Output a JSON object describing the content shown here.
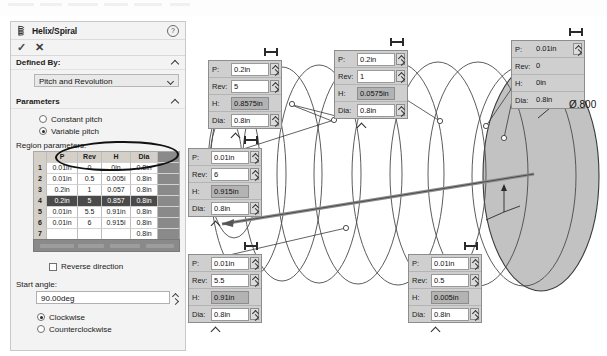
{
  "panel": {
    "title": "Helix/Spiral",
    "icon": "helix-icon",
    "help_icon": "help-icon",
    "accept_icon": "checkmark-icon",
    "cancel_icon": "close-icon",
    "sections": {
      "defined_by": {
        "label": "Defined By:",
        "value": "Pitch and Revolution"
      },
      "parameters": {
        "label": "Parameters",
        "constant_pitch": "Constant pitch",
        "variable_pitch": "Variable pitch",
        "selected": "Variable pitch"
      },
      "region_parameters": {
        "label": "Region parameters:",
        "columns": [
          "",
          "P",
          "Rev",
          "H",
          "Dia"
        ],
        "rows": [
          {
            "idx": "1",
            "p": "0.01in",
            "rev": "0",
            "h": "0in",
            "dia": "0.8in",
            "selected": false
          },
          {
            "idx": "2",
            "p": "0.01in",
            "rev": "0.5",
            "h": "0.005i",
            "dia": "0.8in",
            "selected": false
          },
          {
            "idx": "3",
            "p": "0.2in",
            "rev": "1",
            "h": "0.057",
            "dia": "0.8in",
            "selected": false
          },
          {
            "idx": "4",
            "p": "0.2in",
            "rev": "5",
            "h": "0.857",
            "dia": "0.8in",
            "selected": true
          },
          {
            "idx": "5",
            "p": "0.01in",
            "rev": "5.5",
            "h": "0.91in",
            "dia": "0.8in",
            "selected": false
          },
          {
            "idx": "6",
            "p": "0.01in",
            "rev": "6",
            "h": "0.915i",
            "dia": "0.8in",
            "selected": false
          },
          {
            "idx": "7",
            "p": "",
            "rev": "",
            "h": "",
            "dia": "0.8in",
            "selected": false
          }
        ]
      },
      "reverse_direction": {
        "label": "Reverse direction",
        "checked": false
      },
      "start_angle": {
        "label": "Start angle:",
        "value": "90.00deg"
      },
      "direction": {
        "clockwise": "Clockwise",
        "counterclockwise": "Counterclockwise",
        "selected": "Clockwise"
      }
    }
  },
  "graphics": {
    "dimension_label": "Ø.800",
    "callouts": [
      {
        "id": "callout-rev5",
        "rows": [
          {
            "key": "P:",
            "value": "0.2in",
            "spinner": true,
            "highlight": false
          },
          {
            "key": "Rev:",
            "value": "5",
            "spinner": true,
            "highlight": false
          },
          {
            "key": "H:",
            "value": "0.8575in",
            "spinner": false,
            "highlight": true
          },
          {
            "key": "Dia:",
            "value": "0.8in",
            "spinner": true,
            "highlight": false
          }
        ]
      },
      {
        "id": "callout-rev1",
        "rows": [
          {
            "key": "P:",
            "value": "0.2in",
            "spinner": true,
            "highlight": false
          },
          {
            "key": "Rev:",
            "value": "1",
            "spinner": true,
            "highlight": false
          },
          {
            "key": "H:",
            "value": "0.0575in",
            "spinner": false,
            "highlight": true
          },
          {
            "key": "Dia:",
            "value": "0.8in",
            "spinner": true,
            "highlight": false
          }
        ]
      },
      {
        "id": "callout-rev0",
        "rows": [
          {
            "key": "P:",
            "value": "0.01in",
            "spinner": true,
            "highlight": false
          },
          {
            "key": "Rev:",
            "value": "0",
            "spinner": false,
            "highlight": false
          },
          {
            "key": "H:",
            "value": "0in",
            "spinner": false,
            "highlight": false
          },
          {
            "key": "Dia:",
            "value": "0.8in",
            "spinner": false,
            "highlight": false
          }
        ]
      },
      {
        "id": "callout-rev6",
        "rows": [
          {
            "key": "P:",
            "value": "0.01in",
            "spinner": true,
            "highlight": false
          },
          {
            "key": "Rev:",
            "value": "6",
            "spinner": true,
            "highlight": false
          },
          {
            "key": "H:",
            "value": "0.915in",
            "spinner": false,
            "highlight": true
          },
          {
            "key": "Dia:",
            "value": "0.8in",
            "spinner": true,
            "highlight": false
          }
        ]
      },
      {
        "id": "callout-rev55",
        "rows": [
          {
            "key": "P:",
            "value": "0.01in",
            "spinner": true,
            "highlight": false
          },
          {
            "key": "Rev:",
            "value": "5.5",
            "spinner": true,
            "highlight": false
          },
          {
            "key": "H:",
            "value": "0.91in",
            "spinner": false,
            "highlight": true
          },
          {
            "key": "Dia:",
            "value": "0.8in",
            "spinner": true,
            "highlight": false
          }
        ]
      },
      {
        "id": "callout-rev05",
        "rows": [
          {
            "key": "P:",
            "value": "0.01in",
            "spinner": true,
            "highlight": false
          },
          {
            "key": "Rev:",
            "value": "0.5",
            "spinner": true,
            "highlight": false
          },
          {
            "key": "H:",
            "value": "0.005in",
            "spinner": false,
            "highlight": true
          },
          {
            "key": "Dia:",
            "value": "0.8in",
            "spinner": true,
            "highlight": false
          }
        ]
      }
    ]
  }
}
